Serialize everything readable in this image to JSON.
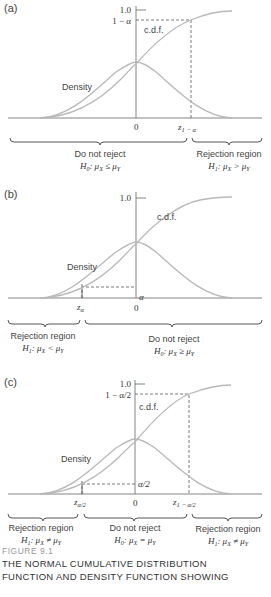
{
  "figure": {
    "number_label": "FIGURE 9.1",
    "caption_line1": "THE NORMAL CUMULATIVE DISTRIBUTION",
    "caption_line2": "FUNCTION AND DENSITY FUNCTION SHOWING"
  },
  "panels": [
    {
      "id": "a",
      "label": "(a)",
      "y_tick_top": "1.0",
      "y_tick_level": "1 − α",
      "cdf_label": "c.d.f.",
      "density_label": "Density",
      "x_zero": "0",
      "x_crit_right": "z",
      "x_crit_right_sub": "1 − α",
      "regions": [
        {
          "title": "Do not reject",
          "hypothesis": "H₀: μₓ ≤ μᵧ",
          "h": "H",
          "h_sub": "0",
          "rel": ": μ",
          "x_sub": "X",
          "op": " ≤ μ",
          "y_sub": "Y"
        },
        {
          "title": "Rejection region",
          "hypothesis": "H₁: μₓ > μᵧ",
          "h": "H",
          "h_sub": "1",
          "rel": ": μ",
          "x_sub": "X",
          "op": " > μ",
          "y_sub": "Y"
        }
      ]
    },
    {
      "id": "b",
      "label": "(b)",
      "y_tick_top": "1.0",
      "y_tick_level": "α",
      "cdf_label": "c.d.f.",
      "density_label": "Density",
      "x_zero": "0",
      "x_crit_left": "z",
      "x_crit_left_sub": "α",
      "regions": [
        {
          "title": "Rejection region",
          "hypothesis": "H₁: μₓ < μᵧ",
          "h": "H",
          "h_sub": "1",
          "rel": ": μ",
          "x_sub": "X",
          "op": " < μ",
          "y_sub": "Y"
        },
        {
          "title": "Do not reject",
          "hypothesis": "H₀: μₓ ≥ μᵧ",
          "h": "H",
          "h_sub": "0",
          "rel": ": μ",
          "x_sub": "X",
          "op": " ≥ μ",
          "y_sub": "Y"
        }
      ]
    },
    {
      "id": "c",
      "label": "(c)",
      "y_tick_top": "1.0",
      "y_tick_level": "1 − α/2",
      "y_tick_low": "α/2",
      "cdf_label": "c.d.f.",
      "density_label": "Density",
      "x_zero": "0",
      "x_crit_left": "z",
      "x_crit_left_sub": "α/2",
      "x_crit_right": "z",
      "x_crit_right_sub": "1 − α/2",
      "regions": [
        {
          "title": "Rejection region",
          "hypothesis": "H₁: μₓ ≠ μᵧ",
          "h": "H",
          "h_sub": "1",
          "rel": ": μ",
          "x_sub": "X",
          "op": " ≠ μ",
          "y_sub": "Y"
        },
        {
          "title": "Do not reject",
          "hypothesis": "H₀: μₓ = μᵧ",
          "h": "H",
          "h_sub": "0",
          "rel": ": μ",
          "x_sub": "X",
          "op": " = μ",
          "y_sub": "Y"
        },
        {
          "title": "Rejection region",
          "hypothesis": "H₁: μₓ ≠ μᵧ",
          "h": "H",
          "h_sub": "1",
          "rel": ": μ",
          "x_sub": "X",
          "op": " ≠ μ",
          "y_sub": "Y"
        }
      ]
    }
  ],
  "colors": {
    "curve": "#b8b8b8",
    "axis": "#555555",
    "dashed": "#444444",
    "brace": "#555555",
    "caption_gray": "#999999"
  }
}
